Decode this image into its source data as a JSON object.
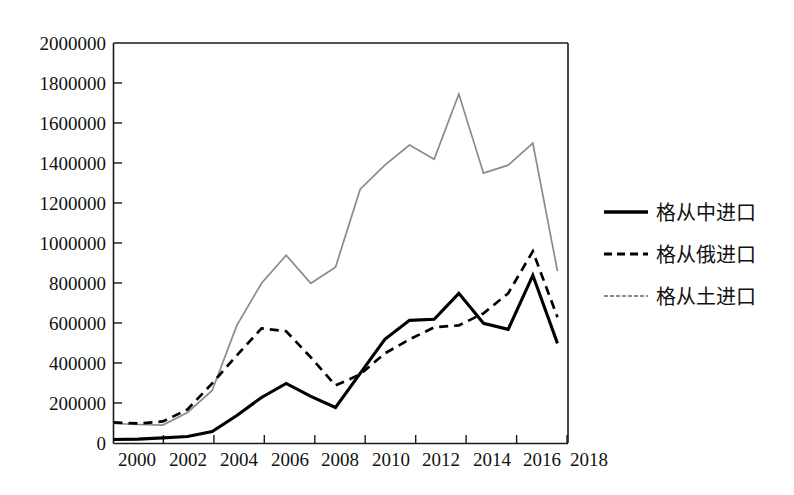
{
  "chart_data": {
    "type": "line",
    "title": "",
    "subtitle": "",
    "xlabel": "",
    "ylabel": "",
    "x": [
      2000,
      2001,
      2002,
      2003,
      2004,
      2005,
      2006,
      2007,
      2008,
      2009,
      2010,
      2011,
      2012,
      2013,
      2014,
      2015,
      2016,
      2017,
      2018
    ],
    "xlim": [
      2000,
      2018
    ],
    "ylim": [
      0,
      2000000
    ],
    "xticks": [
      2000,
      2002,
      2004,
      2006,
      2008,
      2010,
      2012,
      2014,
      2016,
      2018
    ],
    "xtick_labels": [
      "2000",
      "2002",
      "2004",
      "2006",
      "2008",
      "2010",
      "2012",
      "2014",
      "2016",
      "2018"
    ],
    "yticks": [
      0,
      200000,
      400000,
      600000,
      800000,
      1000000,
      1200000,
      1400000,
      1600000,
      1800000,
      2000000
    ],
    "ytick_labels": [
      "0",
      "200000",
      "400000",
      "600000",
      "800000",
      "1000000",
      "1200000",
      "1400000",
      "1600000",
      "1800000",
      "2000000"
    ],
    "grid": false,
    "legend_position": "right",
    "series": [
      {
        "name": "格从中进口",
        "style": "solid",
        "color": "#000000",
        "values": [
          20000,
          22000,
          28000,
          35000,
          60000,
          140000,
          230000,
          300000,
          235000,
          180000,
          350000,
          520000,
          615000,
          620000,
          750000,
          600000,
          570000,
          840000,
          500000
        ]
      },
      {
        "name": "格从俄进口",
        "style": "dashed",
        "color": "#000000",
        "values": [
          105000,
          100000,
          110000,
          170000,
          300000,
          440000,
          575000,
          560000,
          430000,
          290000,
          345000,
          450000,
          520000,
          580000,
          590000,
          650000,
          750000,
          960000,
          630000
        ]
      },
      {
        "name": "格从土进口",
        "style": "solid-gray",
        "color": "#8a8a8a",
        "values": [
          100000,
          95000,
          92000,
          155000,
          265000,
          590000,
          800000,
          940000,
          800000,
          880000,
          1270000,
          1390000,
          1490000,
          1420000,
          1745000,
          1350000,
          1390000,
          1500000,
          860000
        ]
      }
    ]
  },
  "legend": {
    "items": [
      {
        "label": "格从中进口",
        "style": "solid"
      },
      {
        "label": "格从俄进口",
        "style": "dashed"
      },
      {
        "label": "格从土进口",
        "style": "solid-gray"
      }
    ]
  },
  "axes": {
    "y_tick_labels": [
      "2000000",
      "1800000",
      "1600000",
      "1400000",
      "1200000",
      "1000000",
      "800000",
      "600000",
      "400000",
      "200000",
      "0"
    ],
    "x_tick_labels": [
      "2000",
      "2002",
      "2004",
      "2006",
      "2008",
      "2010",
      "2012",
      "2014",
      "2016",
      "2018"
    ]
  },
  "colors": {
    "china": "#000000",
    "russia": "#000000",
    "turkey": "#8a8a8a",
    "axis": "#1a1a1a",
    "background": "#ffffff"
  }
}
